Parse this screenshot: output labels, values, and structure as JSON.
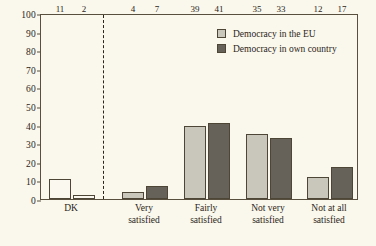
{
  "chart_data": {
    "type": "bar",
    "title": "",
    "xlabel": "",
    "ylabel": "",
    "ylim": [
      0,
      100
    ],
    "ytick_step": 10,
    "yticks": [
      0,
      10,
      20,
      30,
      40,
      50,
      60,
      70,
      80,
      90,
      100
    ],
    "grid": false,
    "legend_position": "top-right",
    "categories": [
      "DK",
      "Very satisfied",
      "Fairly satisfied",
      "Not very satisfied",
      "Not at all satisfied"
    ],
    "category_lines": [
      [
        "DK"
      ],
      [
        "Very",
        "satisfied"
      ],
      [
        "Fairly",
        "satisfied"
      ],
      [
        "Not very",
        "satisfied"
      ],
      [
        "Not at all",
        "satisfied"
      ]
    ],
    "series": [
      {
        "name": "Democracy in the EU",
        "color": "#c9c7bb",
        "values": [
          11,
          4,
          39,
          35,
          12
        ]
      },
      {
        "name": "Democracy in own country",
        "color": "#66625a",
        "values": [
          2,
          7,
          41,
          33,
          17
        ]
      }
    ],
    "annotations": [
      {
        "type": "vertical-dashed-line",
        "after_category": "DK",
        "note": "dashed separator between DK and the satisfaction scale"
      }
    ]
  },
  "legend": {
    "entries": [
      {
        "label": "Democracy in the EU",
        "color": "#c9c7bb"
      },
      {
        "label": "Democracy in own country",
        "color": "#66625a"
      }
    ]
  },
  "colors": {
    "background": "#faf8ec",
    "axis": "#584f3e",
    "text": "#2b2519",
    "series_eu": "#c9c7bb",
    "series_own": "#66625a",
    "bar_unfilled": "#fbf9ef"
  }
}
